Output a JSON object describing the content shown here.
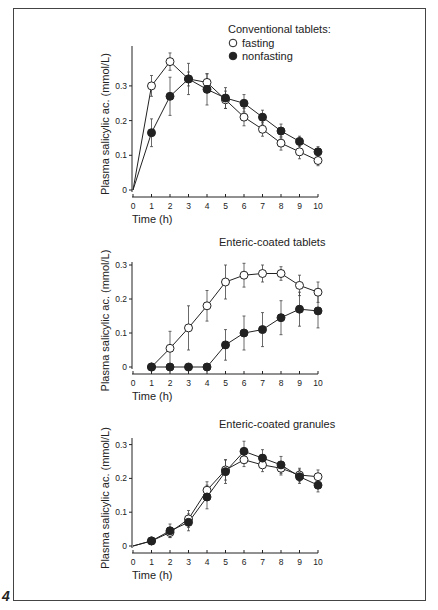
{
  "figure": {
    "number": "4"
  },
  "chart_data": [
    {
      "type": "line",
      "title": "Conventional tablets:",
      "xlabel": "Time (h)",
      "ylabel": "Plasma salicylic ac. (mmol/L)",
      "x": [
        0,
        1,
        2,
        3,
        4,
        5,
        6,
        7,
        8,
        9,
        10
      ],
      "xticks": [
        "0",
        "1",
        "2",
        "3",
        "4",
        "5",
        "6",
        "7",
        "8",
        "9",
        "10"
      ],
      "yticks": [
        "0",
        "0.1",
        "0.2",
        "0.3"
      ],
      "ylim": [
        0,
        0.3
      ],
      "grid": false,
      "legend_position": "top-right",
      "series": [
        {
          "name": "fasting",
          "marker": "open-circle",
          "values": [
            0,
            0.3,
            0.37,
            0.32,
            0.31,
            0.26,
            0.21,
            0.175,
            0.135,
            0.11,
            0.085
          ],
          "error": [
            0,
            0.03,
            0.025,
            0.02,
            0.025,
            0.025,
            0.025,
            0.02,
            0.02,
            0.02,
            0.015
          ]
        },
        {
          "name": "nonfasting",
          "marker": "filled-circle",
          "values": [
            0,
            0.165,
            0.27,
            0.32,
            0.29,
            0.265,
            0.25,
            0.21,
            0.17,
            0.14,
            0.11
          ],
          "error": [
            0,
            0.04,
            0.055,
            0.045,
            0.045,
            0.03,
            0.025,
            0.02,
            0.02,
            0.015,
            0.015
          ]
        }
      ]
    },
    {
      "type": "line",
      "title": "Enteric-coated tablets",
      "xlabel": "Time (h)",
      "ylabel": "Plasma salicylic ac. (mmol/L)",
      "x": [
        1,
        2,
        3,
        4,
        5,
        6,
        7,
        8,
        9,
        10
      ],
      "xticks": [
        "0",
        "1",
        "2",
        "3",
        "4",
        "5",
        "6",
        "7",
        "8",
        "9",
        "10"
      ],
      "yticks": [
        "0",
        "0.1",
        "0.2",
        "0.3"
      ],
      "ylim": [
        0,
        0.3
      ],
      "grid": false,
      "series": [
        {
          "name": "fasting",
          "marker": "open-circle",
          "values": [
            0,
            0.055,
            0.115,
            0.18,
            0.25,
            0.27,
            0.275,
            0.275,
            0.24,
            0.22
          ],
          "error": [
            0,
            0.05,
            0.065,
            0.045,
            0.05,
            0.035,
            0.025,
            0.02,
            0.03,
            0.03
          ]
        },
        {
          "name": "nonfasting",
          "marker": "filled-circle",
          "values": [
            0,
            0,
            0,
            0,
            0.065,
            0.1,
            0.11,
            0.145,
            0.17,
            0.165
          ],
          "error": [
            0,
            0,
            0,
            0,
            0.045,
            0.05,
            0.05,
            0.05,
            0.05,
            0.05
          ]
        }
      ]
    },
    {
      "type": "line",
      "title": "Enteric-coated granules",
      "xlabel": "Time (h)",
      "ylabel": "Plasma salicylic ac. (mmol/L)",
      "x": [
        0,
        1,
        2,
        3,
        4,
        5,
        6,
        7,
        8,
        9,
        10
      ],
      "xticks": [
        "0",
        "1",
        "2",
        "3",
        "4",
        "5",
        "6",
        "7",
        "8",
        "9",
        "10"
      ],
      "yticks": [
        "0",
        "0.1",
        "0.2",
        "0.3"
      ],
      "ylim": [
        0,
        0.3
      ],
      "grid": false,
      "series": [
        {
          "name": "fasting",
          "marker": "open-circle",
          "values": [
            0,
            0.015,
            0.04,
            0.08,
            0.165,
            0.225,
            0.255,
            0.24,
            0.23,
            0.21,
            0.205
          ],
          "error": [
            0,
            0.005,
            0.015,
            0.025,
            0.025,
            0.03,
            0.02,
            0.02,
            0.02,
            0.02,
            0.02
          ]
        },
        {
          "name": "nonfasting",
          "marker": "filled-circle",
          "values": [
            0,
            0.015,
            0.045,
            0.07,
            0.145,
            0.22,
            0.28,
            0.26,
            0.24,
            0.205,
            0.18
          ],
          "error": [
            0,
            0.005,
            0.02,
            0.025,
            0.035,
            0.035,
            0.03,
            0.025,
            0.025,
            0.02,
            0.02
          ]
        }
      ]
    }
  ]
}
